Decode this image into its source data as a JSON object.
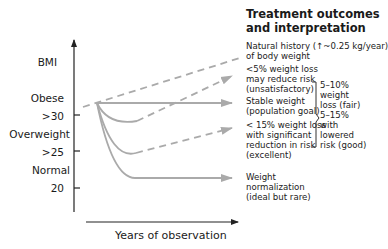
{
  "title": {
    "line1": "Treatment outcomes",
    "line2": "and interpretation"
  },
  "y_axis": {
    "label": "BMI",
    "categories": [
      {
        "name": "Obese",
        "threshold": ">30"
      },
      {
        "name": "Overweight",
        "threshold": ">25"
      },
      {
        "name": "Normal",
        "threshold": "20"
      }
    ]
  },
  "x_axis": {
    "label": "Years of observation"
  },
  "outcomes": [
    {
      "id": "natural-history",
      "line_style": "dashed",
      "lines": [
        "Natural history  (↑~0.25 kg/year)",
        "of body weight"
      ]
    },
    {
      "id": "lt5-loss",
      "line_style": "dashed",
      "lines": [
        "<5% weight loss",
        "may reduce risk",
        "(unsatisfactory)"
      ]
    },
    {
      "id": "stable-weight",
      "line_style": "solid",
      "lines": [
        "Stable weight",
        "(population goal)"
      ]
    },
    {
      "id": "lt15-loss",
      "line_style": "dashed",
      "lines": [
        "< 15% weight loss",
        "with significant",
        "reduction in risk",
        "(excellent)"
      ]
    },
    {
      "id": "normalization",
      "line_style": "solid",
      "lines": [
        "Weight",
        "normalization",
        "(ideal but rare)"
      ]
    }
  ],
  "bracket_note": {
    "lines": [
      "5–10%",
      "weight",
      "loss (fair)",
      "5–15%",
      "with",
      "lowered",
      "risk (good)"
    ]
  },
  "colors": {
    "axis": "#222222",
    "curves": "#aaaaaa",
    "text": "#1a1a1a"
  }
}
